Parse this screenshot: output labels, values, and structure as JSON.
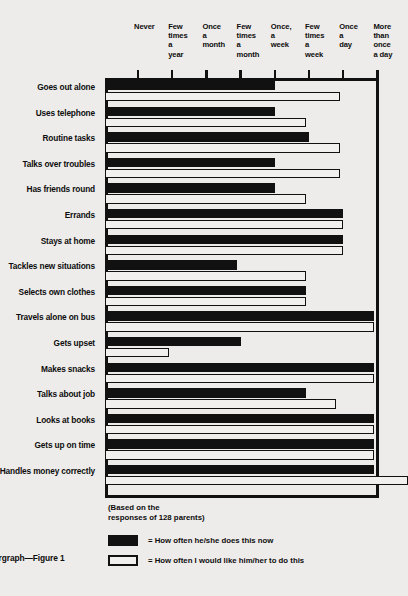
{
  "figure": {
    "caption": "argraph—Figure 1",
    "note": "(Based on the\nresponses of 128 parents)"
  },
  "legend": {
    "items": [
      {
        "swatch": "filled-black",
        "label": "= How often he/she does this now"
      },
      {
        "swatch": "outline-white",
        "label": "= How often I would like him/her to do this"
      }
    ]
  },
  "colors": {
    "ink": "#111111",
    "paper": "#eeecea",
    "bar_now": "#111111",
    "bar_want": "#f2f0ee"
  },
  "chart_data": {
    "type": "bar",
    "orientation": "horizontal",
    "title": "",
    "subtitle": "(Based on the responses of 128 parents)",
    "xlabel": "",
    "ylabel": "",
    "grid": false,
    "legend_position": "bottom-left",
    "x_tick_labels": [
      "Never",
      "Few\ntimes\na\nyear",
      "Once\na\nmonth",
      "Few\ntimes\na\nmonth",
      "Once,\na\nweek",
      "Few\ntimes\na\nweek",
      "Once\na\nday",
      "More\nthan\nonce\na day"
    ],
    "x_tick_values": [
      0,
      1,
      2,
      3,
      4,
      5,
      6,
      7
    ],
    "xlim": [
      -1,
      7
    ],
    "categories": [
      "Goes out alone",
      "Uses telephone",
      "Routine tasks",
      "Talks over troubles",
      "Has friends round",
      "Errands",
      "Stays at home",
      "Tackles new situations",
      "Selects own clothes",
      "Travels alone on bus",
      "Gets upset",
      "Makes snacks",
      "Talks about job",
      "Looks at books",
      "Gets up on time",
      "Handles money correctly"
    ],
    "series": [
      {
        "name": "How often he/she does this now",
        "style": "filled-black",
        "values": [
          4.0,
          4.0,
          5.0,
          4.0,
          4.0,
          6.0,
          6.0,
          2.9,
          4.9,
          6.9,
          3.0,
          6.9,
          4.9,
          6.9,
          6.9,
          6.9
        ]
      },
      {
        "name": "How often I would like him/her to do this",
        "style": "outline-white",
        "values": [
          5.9,
          4.9,
          5.9,
          5.9,
          4.9,
          6.0,
          6.0,
          4.9,
          4.9,
          6.9,
          0.9,
          6.9,
          5.8,
          6.9,
          6.9,
          7.9
        ]
      }
    ]
  }
}
